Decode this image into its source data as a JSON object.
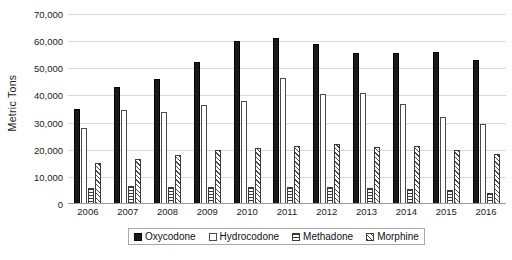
{
  "chart_data": {
    "type": "bar",
    "title": "",
    "subtitle": "",
    "xlabel": "",
    "ylabel": "Metric Tons",
    "categories": [
      "2006",
      "2007",
      "2008",
      "2009",
      "2010",
      "2011",
      "2012",
      "2013",
      "2014",
      "2015",
      "2016"
    ],
    "ylim": [
      0,
      70000
    ],
    "yticks": [
      0,
      10000,
      20000,
      30000,
      40000,
      50000,
      60000,
      70000
    ],
    "ytick_labels": [
      "0",
      "10,000",
      "20,000",
      "30,000",
      "40,000",
      "50,000",
      "60,000",
      "70,000"
    ],
    "grid": true,
    "legend_position": "bottom",
    "series": [
      {
        "name": "Oxycodone",
        "pattern": "solid-black",
        "color": "#1a1a1a",
        "values": [
          35000,
          43000,
          46000,
          52500,
          60000,
          61000,
          59000,
          55500,
          55500,
          56000,
          53000
        ]
      },
      {
        "name": "Hydrocodone",
        "pattern": "fine-dots",
        "color": "#ffffff",
        "values": [
          28000,
          34500,
          34000,
          36500,
          38000,
          46500,
          40500,
          41000,
          37000,
          32000,
          29500
        ]
      },
      {
        "name": "Methadone",
        "pattern": "horizontal-lines",
        "color": "#ffffff",
        "values": [
          6000,
          6800,
          6200,
          6400,
          6400,
          6400,
          6200,
          5800,
          5600,
          5000,
          4200
        ]
      },
      {
        "name": "Morphine",
        "pattern": "diagonal-hatch",
        "color": "#ffffff",
        "values": [
          15000,
          16500,
          18000,
          20000,
          20500,
          21500,
          22000,
          21000,
          21500,
          20000,
          18500
        ]
      }
    ]
  }
}
